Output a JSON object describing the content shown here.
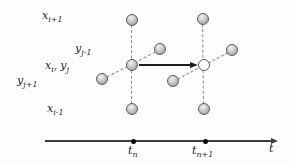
{
  "colors": {
    "bg": "#fdfdfd",
    "label": "#1f1f1f",
    "dashed": "#8a8a8a",
    "node_stroke": "#5c5c5c",
    "node_fill_light": "#f2f2f2",
    "node_fill_mid": "#c9c9c9",
    "node_fill_dark": "#8e8e8e",
    "open_node_fill": "#ffffff",
    "arrow": "#1c1c1c",
    "axis": "#3c3c3c",
    "dot": "#0a0a0a"
  },
  "labels": {
    "x_ip1": {
      "base": "x",
      "sub": "i+1"
    },
    "y_jm1": {
      "base": "y",
      "sub": "j-1"
    },
    "xy": {
      "base1": "x",
      "sub1": "i",
      "sep": ",",
      "base2": "y",
      "sub2": "j"
    },
    "y_jp1": {
      "base": "y",
      "sub": "j+1"
    },
    "x_im1": {
      "base": "x",
      "sub": "i-1"
    },
    "t_n": {
      "base": "t",
      "sub": "n"
    },
    "t_np1": {
      "base": "t",
      "sub": "n+1"
    },
    "t": {
      "base": "t"
    }
  },
  "diagram": {
    "node_radius": 6,
    "nodes": [
      {
        "x": 132,
        "y": 20,
        "type": "filled",
        "name": "node-x-i+1-tn"
      },
      {
        "x": 203,
        "y": 19,
        "type": "filled",
        "name": "node-x-i+1-tn+1"
      },
      {
        "x": 160,
        "y": 49,
        "type": "filled",
        "name": "node-y-j-1-tn"
      },
      {
        "x": 232,
        "y": 50,
        "type": "filled",
        "name": "node-y-j-1-tn+1"
      },
      {
        "x": 132,
        "y": 65,
        "type": "filled",
        "name": "node-center-tn"
      },
      {
        "x": 204,
        "y": 65,
        "type": "open",
        "name": "node-center-tn+1"
      },
      {
        "x": 102,
        "y": 79,
        "type": "filled",
        "name": "node-y-j+1-tn"
      },
      {
        "x": 173,
        "y": 81,
        "type": "filled",
        "name": "node-y-j+1-tn+1"
      },
      {
        "x": 132,
        "y": 109,
        "type": "filled",
        "name": "node-x-i-1-tn"
      },
      {
        "x": 204,
        "y": 109,
        "type": "filled",
        "name": "node-x-i-1-tn+1"
      }
    ],
    "edges": [
      {
        "x1": 132,
        "y1": 20,
        "x2": 132,
        "y2": 109
      },
      {
        "x1": 203,
        "y1": 19,
        "x2": 204,
        "y2": 109
      },
      {
        "x1": 102,
        "y1": 79,
        "x2": 160,
        "y2": 49
      },
      {
        "x1": 173,
        "y1": 81,
        "x2": 232,
        "y2": 50
      }
    ],
    "arrow": {
      "x1": 139,
      "y1": 65,
      "x2": 198,
      "y2": 65
    },
    "axis": {
      "x1": 45,
      "x2": 278,
      "y": 141,
      "ticks": [
        {
          "x": 133
        },
        {
          "x": 205
        }
      ]
    }
  }
}
